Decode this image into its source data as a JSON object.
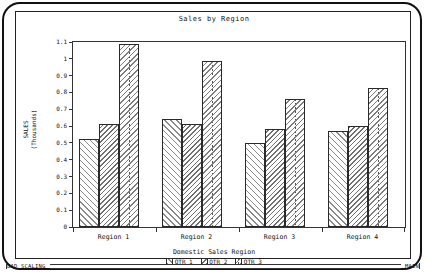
{
  "chart_data": {
    "type": "bar",
    "title": "Sales by Region",
    "xlabel": "Domestic Sales Region",
    "ylabel_line1": "SALES",
    "ylabel_line2": "(Thousands)",
    "categories": [
      "Region 1",
      "Region 2",
      "Region 3",
      "Region 4"
    ],
    "series": [
      {
        "name": "QTR 1",
        "values": [
          0.525,
          0.645,
          0.5,
          0.57
        ]
      },
      {
        "name": "QTR 2",
        "values": [
          0.61,
          0.615,
          0.585,
          0.6
        ]
      },
      {
        "name": "QTR 3",
        "values": [
          1.09,
          0.99,
          0.76,
          0.825
        ]
      }
    ],
    "ylim": [
      0,
      1.1
    ],
    "yticks": [
      "0",
      "0.1",
      "0.2",
      "0.3",
      "0.4",
      "0.5",
      "0.6",
      "0.7",
      "0.8",
      "0.9",
      "1",
      "1.1"
    ],
    "ytick_values": [
      0,
      0.1,
      0.2,
      0.3,
      0.4,
      0.5,
      0.6,
      0.7,
      0.8,
      0.9,
      1.0,
      1.1
    ],
    "grid": false,
    "legend_position": "bottom"
  },
  "statusbar": {
    "left_label": "BAD SCALING",
    "right_label": "MAIN"
  }
}
